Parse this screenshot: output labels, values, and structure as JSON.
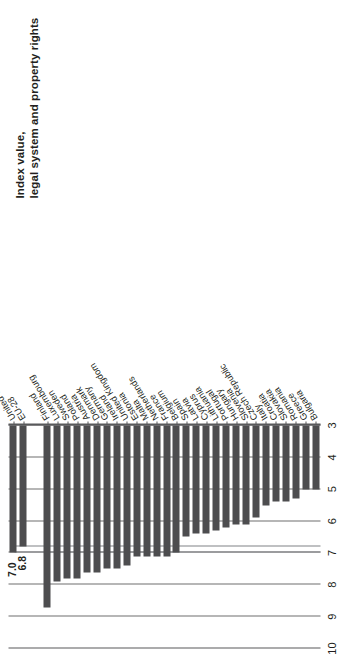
{
  "chart_data": {
    "type": "bar",
    "orientation": "horizontal",
    "title": "",
    "xlabel": "Index value,\nlegal system and property rights",
    "ylabel": "",
    "axis_title_line1": "Index value,",
    "axis_title_line2": "legal system and property rights",
    "xlim": [
      3,
      10
    ],
    "ticks": [
      10,
      9,
      8,
      7,
      6,
      5,
      4,
      3
    ],
    "tick_labels": [
      "10",
      "9",
      "8",
      "7",
      "6",
      "5",
      "4",
      "3"
    ],
    "grid": true,
    "legend": "none",
    "bar_color": "#4d4d4f",
    "reference_lines": [
      {
        "value": 7.0,
        "label": "7.0"
      },
      {
        "value": 6.8,
        "label": "6.8"
      }
    ],
    "value_labels": [
      "7.0",
      "6.8"
    ],
    "categories": [
      "United States",
      "EU-28",
      "Finland",
      "Luxembourg",
      "Sweden",
      "Poland",
      "Austria",
      "Denmark",
      "Germany",
      "Ireland",
      "United Kingdom",
      "Estonia",
      "Malta",
      "Netherlands",
      "France",
      "Belgium",
      "Spain",
      "Latvia",
      "Cyprus",
      "Lithuania",
      "Portugal",
      "Hungary",
      "Slovenia",
      "Czech Republic",
      "Italy",
      "Croatia",
      "Slovakia",
      "Romania",
      "Greece",
      "Bulgaria"
    ],
    "values": [
      7.0,
      6.8,
      8.7,
      7.9,
      7.8,
      7.8,
      7.6,
      7.6,
      7.5,
      7.5,
      7.4,
      7.1,
      7.1,
      7.1,
      7.1,
      7.0,
      6.5,
      6.4,
      6.4,
      6.3,
      6.2,
      6.1,
      6.1,
      5.9,
      5.5,
      5.4,
      5.4,
      5.3,
      5.0,
      5.0
    ],
    "group_break_after_index": 1
  },
  "chart": {
    "tick_labels": [
      "10",
      "9",
      "8",
      "7",
      "6",
      "5",
      "4",
      "3"
    ]
  }
}
